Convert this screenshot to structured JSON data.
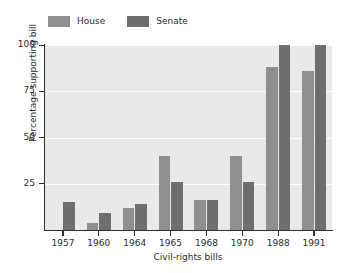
{
  "chart_data": {
    "type": "bar",
    "title": "",
    "xlabel": "Civil-rights bills",
    "ylabel": "Percentage supporting bill",
    "categories": [
      "1957",
      "1960",
      "1964",
      "1965",
      "1968",
      "1970",
      "1988",
      "1991"
    ],
    "series": [
      {
        "name": "House",
        "color": "#8f8f8f",
        "values": [
          0,
          4,
          12,
          40,
          16,
          40,
          88,
          86
        ]
      },
      {
        "name": "Senate",
        "color": "#6e6e6e",
        "values": [
          15,
          9,
          14,
          26,
          16,
          26,
          100,
          100
        ]
      }
    ],
    "ylim": [
      0,
      100
    ],
    "yticks": [
      25,
      50,
      75,
      100
    ],
    "ytick_labels": [
      "25",
      "50",
      "75",
      "100"
    ],
    "grid": "horizontal-white",
    "legend_position": "top-left",
    "plot_background": "#e9e9e9"
  },
  "legend": {
    "entries": [
      {
        "label": "House"
      },
      {
        "label": "Senate"
      }
    ]
  }
}
